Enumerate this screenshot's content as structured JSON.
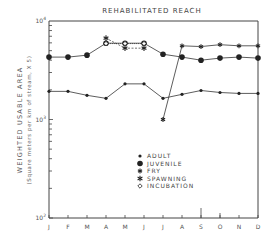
{
  "chart_data": {
    "type": "line",
    "title": "REHABILITATED REACH",
    "xlabel": "",
    "ylabel": "WEIGHTED USABLE AREA",
    "ylabel_sub": "(Square meters per km of stream, X 5)",
    "yscale": "log",
    "ylim": [
      100,
      10000
    ],
    "y_ticks": [
      "10^2",
      "10^3",
      "10^4"
    ],
    "categories": [
      "J",
      "F",
      "M",
      "A",
      "M",
      "J",
      "J",
      "A",
      "S",
      "O",
      "N",
      "D"
    ],
    "grid": false,
    "legend_position": "lower right inside",
    "series": [
      {
        "name": "ADULT",
        "marker": "small-dot",
        "values": [
          1930,
          1930,
          1760,
          1640,
          2300,
          2300,
          1640,
          1800,
          1970,
          1880,
          1840,
          1840
        ]
      },
      {
        "name": "JUVENILE",
        "marker": "large-dot",
        "values": [
          4300,
          4300,
          4500,
          5950,
          5950,
          5950,
          4600,
          4300,
          4000,
          4200,
          4300,
          4200
        ]
      },
      {
        "name": "FRY",
        "marker": "star",
        "values": [
          null,
          null,
          null,
          null,
          null,
          null,
          1000,
          5600,
          5500,
          5750,
          5600,
          5600
        ]
      },
      {
        "name": "SPAWNING",
        "marker": "small-star",
        "values": [
          null,
          null,
          null,
          6700,
          5300,
          5300,
          null,
          null,
          null,
          null,
          null,
          null
        ]
      },
      {
        "name": "INCUBATION",
        "marker": "open-diamond",
        "values": [
          null,
          null,
          null,
          5900,
          5900,
          5900,
          null,
          null,
          null,
          null,
          null,
          null
        ]
      }
    ]
  },
  "title": "REHABILITATED REACH",
  "axis": {
    "ylabel": "WEIGHTED USABLE AREA",
    "ylabel_sub": "(Square meters per km of stream, X 5)",
    "y_top": "10",
    "y_top_exp": "4",
    "y_mid": "10",
    "y_mid_exp": "3",
    "y_bot": "10",
    "y_bot_exp": "2",
    "months": [
      "J",
      "F",
      "M",
      "A",
      "M",
      "J",
      "J",
      "A",
      "S",
      "O",
      "N",
      "D"
    ]
  },
  "legend": {
    "items": [
      "ADULT",
      "JUVENILE",
      "FRY",
      "SPAWNING",
      "INCUBATION"
    ]
  }
}
